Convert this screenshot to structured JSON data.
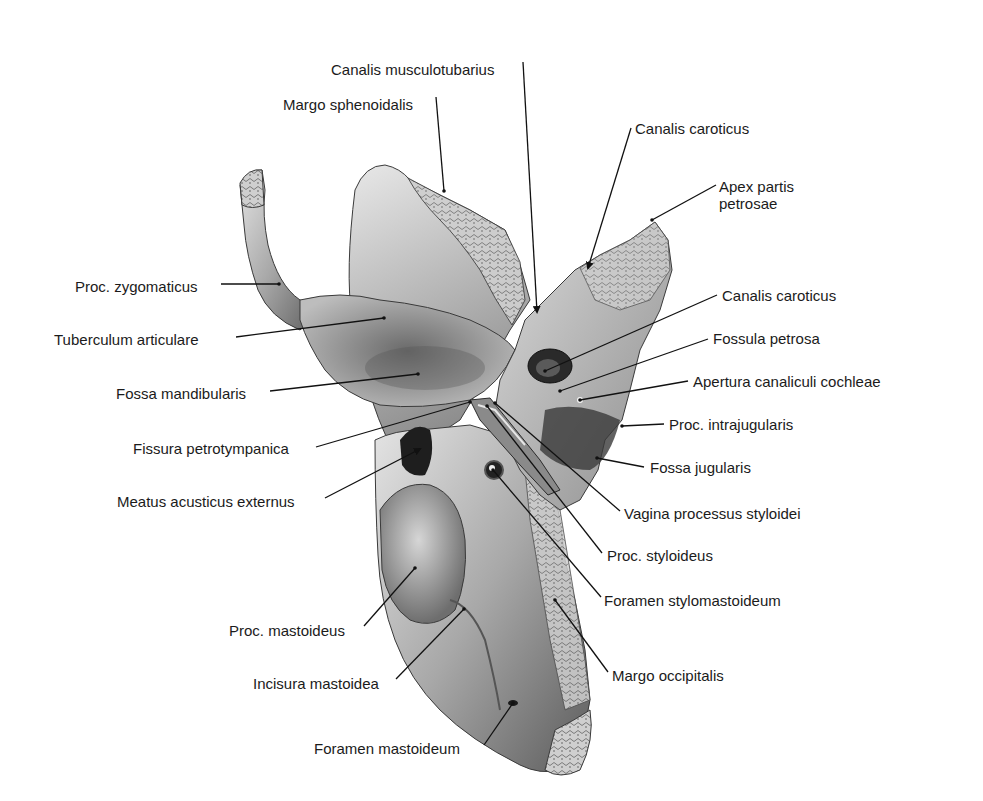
{
  "figure": {
    "colors": {
      "background": "#ffffff",
      "text": "#1b1b1b",
      "leader": "#111111",
      "bone_light": "#d9d9d9",
      "bone_mid": "#9a9a9a",
      "bone_dark": "#3c3c3c"
    }
  },
  "labels": [
    {
      "id": "canalis-musculotubarius",
      "text": "Canalis musculotubarius",
      "x": 331,
      "y": 61,
      "align": "left",
      "line": [
        [
          523,
          62
        ],
        [
          537,
          312
        ]
      ],
      "arrow": true
    },
    {
      "id": "margo-sphenoidalis",
      "text": "Margo sphenoidalis",
      "x": 283,
      "y": 96,
      "align": "left",
      "line": [
        [
          436,
          97
        ],
        [
          444,
          191
        ]
      ],
      "arrow": false
    },
    {
      "id": "canalis-caroticus-top",
      "text": "Canalis caroticus",
      "x": 635,
      "y": 120,
      "align": "left",
      "line": [
        [
          631,
          128
        ],
        [
          588,
          268
        ]
      ],
      "arrow": true
    },
    {
      "id": "apex-partis-petrosae",
      "text": "Apex partis",
      "text2": "petrosae",
      "x": 719,
      "y": 178,
      "align": "left",
      "line": [
        [
          716,
          185
        ],
        [
          652,
          220
        ]
      ],
      "arrow": false
    },
    {
      "id": "proc-zygomaticus",
      "text": "Proc. zygomaticus",
      "x": 75,
      "y": 278,
      "align": "left",
      "line": [
        [
          221,
          284
        ],
        [
          279,
          284
        ]
      ],
      "arrow": false
    },
    {
      "id": "canalis-caroticus-mid",
      "text": "Canalis caroticus",
      "x": 722,
      "y": 287,
      "align": "left",
      "line": [
        [
          717,
          295
        ],
        [
          545,
          371
        ]
      ],
      "arrow": false
    },
    {
      "id": "tuberculum-articulare",
      "text": "Tuberculum articulare",
      "x": 54,
      "y": 331,
      "align": "left",
      "line": [
        [
          236,
          337
        ],
        [
          384,
          318
        ]
      ],
      "arrow": false
    },
    {
      "id": "fossula-petrosa",
      "text": "Fossula petrosa",
      "x": 713,
      "y": 330,
      "align": "left",
      "line": [
        [
          708,
          339
        ],
        [
          560,
          391
        ]
      ],
      "arrow": false
    },
    {
      "id": "fossa-mandibularis",
      "text": "Fossa mandibularis",
      "x": 116,
      "y": 385,
      "align": "left",
      "line": [
        [
          270,
          391
        ],
        [
          418,
          374
        ]
      ],
      "arrow": false
    },
    {
      "id": "apertura-canaliculi-cochleae",
      "text": "Apertura canaliculi cochleae",
      "x": 693,
      "y": 373,
      "align": "left",
      "line": [
        [
          688,
          381
        ],
        [
          580,
          400
        ]
      ],
      "arrow": false
    },
    {
      "id": "proc-intrajugularis",
      "text": "Proc. intrajugularis",
      "x": 669,
      "y": 416,
      "align": "left",
      "line": [
        [
          664,
          424
        ],
        [
          622,
          426
        ]
      ],
      "arrow": false
    },
    {
      "id": "fissura-petrotympanica",
      "text": "Fissura petrotympanica",
      "x": 133,
      "y": 440,
      "align": "left",
      "line": [
        [
          316,
          447
        ],
        [
          470,
          402
        ]
      ],
      "arrow": false
    },
    {
      "id": "fossa-jugularis",
      "text": "Fossa jugularis",
      "x": 650,
      "y": 459,
      "align": "left",
      "line": [
        [
          644,
          467
        ],
        [
          597,
          458
        ]
      ],
      "arrow": false
    },
    {
      "id": "meatus-acusticus-externus",
      "text": "Meatus acusticus externus",
      "x": 117,
      "y": 493,
      "align": "left",
      "line": [
        [
          325,
          498
        ],
        [
          420,
          449
        ]
      ],
      "arrow": true
    },
    {
      "id": "vagina-processus-styloidei",
      "text": "Vagina processus styloidei",
      "x": 624,
      "y": 505,
      "align": "left",
      "line": [
        [
          620,
          511
        ],
        [
          495,
          403
        ]
      ],
      "arrow": false
    },
    {
      "id": "proc-styloideus",
      "text": "Proc. styloideus",
      "x": 607,
      "y": 547,
      "align": "left",
      "line": [
        [
          602,
          553
        ],
        [
          487,
          406
        ]
      ],
      "arrow": false
    },
    {
      "id": "foramen-stylomastoideum",
      "text": "Foramen stylomastoideum",
      "x": 604,
      "y": 592,
      "align": "left",
      "line": [
        [
          601,
          597
        ],
        [
          493,
          470
        ]
      ],
      "arrow": false
    },
    {
      "id": "proc-mastoideus",
      "text": "Proc. mastoideus",
      "x": 229,
      "y": 622,
      "align": "left",
      "line": [
        [
          364,
          626
        ],
        [
          415,
          568
        ]
      ],
      "arrow": false
    },
    {
      "id": "margo-occipitalis",
      "text": "Margo occipitalis",
      "x": 612,
      "y": 667,
      "align": "left",
      "line": [
        [
          608,
          672
        ],
        [
          555,
          600
        ]
      ],
      "arrow": false
    },
    {
      "id": "incisura-mastoidea",
      "text": "Incisura mastoidea",
      "x": 253,
      "y": 675,
      "align": "left",
      "line": [
        [
          396,
          679
        ],
        [
          464,
          609
        ]
      ],
      "arrow": false
    },
    {
      "id": "foramen-mastoideum",
      "text": "Foramen mastoideum",
      "x": 314,
      "y": 740,
      "align": "left",
      "line": [
        [
          484,
          745
        ],
        [
          513,
          703
        ]
      ],
      "arrow": false
    }
  ]
}
